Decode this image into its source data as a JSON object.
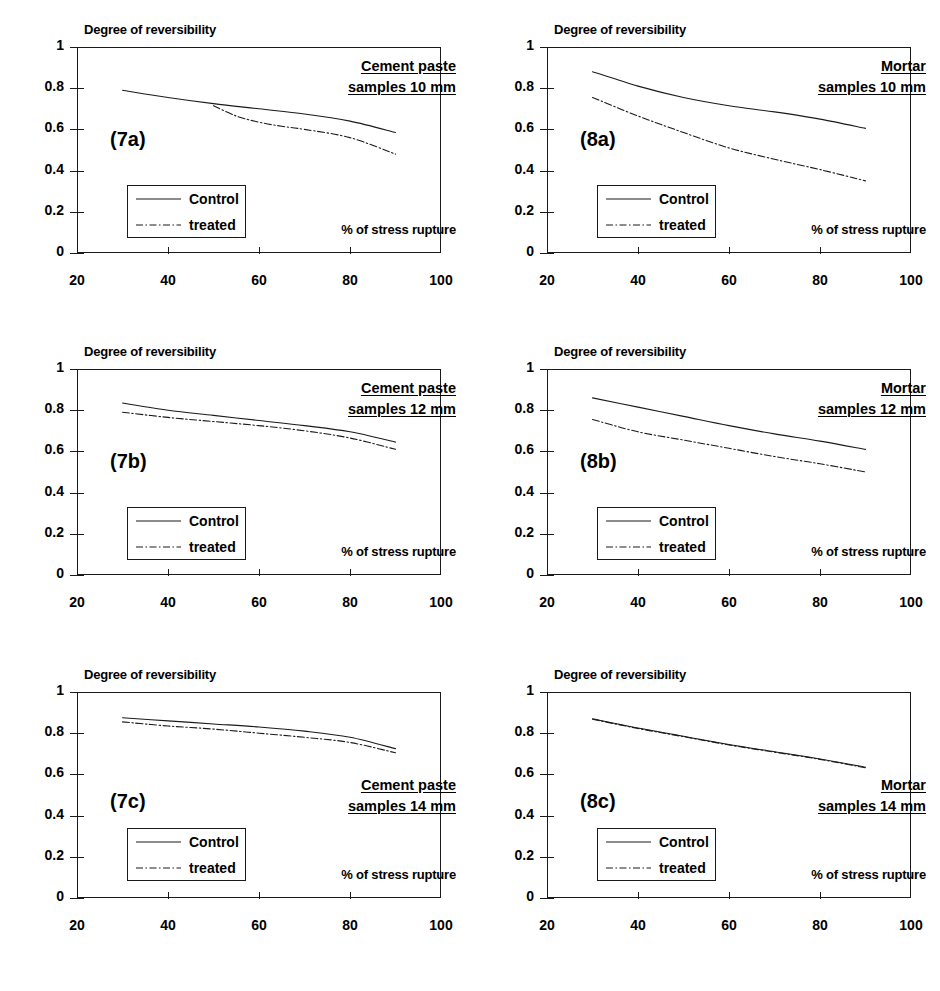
{
  "figure": {
    "axis": {
      "y_title": "Degree of reversibility",
      "x_caption": "% of stress rupture",
      "y_ticks": [
        "0",
        "0.2",
        "0.4",
        "0.6",
        "0.8",
        "1"
      ],
      "x_ticks": [
        "20",
        "40",
        "60",
        "80",
        "100"
      ]
    },
    "legend": {
      "control_label": "Control",
      "treated_label": "treated"
    }
  },
  "chart_data": [
    {
      "type": "line",
      "id": "7a",
      "panel_label": "(7a)",
      "title_line1": "Cement paste",
      "title_line2": "samples 10 mm",
      "title": "Cement paste samples 10 mm",
      "xlabel": "% of stress rupture",
      "ylabel": "Degree of reversibility",
      "xlim": [
        20,
        100
      ],
      "ylim": [
        0,
        1
      ],
      "xticks": [
        20,
        40,
        60,
        80,
        100
      ],
      "yticks": [
        0,
        0.2,
        0.4,
        0.6,
        0.8,
        1
      ],
      "grid": false,
      "legend_position": "lower-left-inside",
      "series": [
        {
          "name": "Control",
          "style": "solid",
          "x": [
            30,
            40,
            50,
            60,
            70,
            80,
            90
          ],
          "values": [
            0.79,
            0.755,
            0.725,
            0.7,
            0.675,
            0.64,
            0.585
          ]
        },
        {
          "name": "treated",
          "style": "dash-dot",
          "x": [
            50,
            55,
            60,
            65,
            70,
            80,
            90
          ],
          "values": [
            0.715,
            0.665,
            0.635,
            0.615,
            0.6,
            0.56,
            0.48
          ]
        }
      ]
    },
    {
      "type": "line",
      "id": "8a",
      "panel_label": "(8a)",
      "title_line1": "Mortar",
      "title_line2": "samples 10 mm",
      "title": "Mortar samples 10 mm",
      "xlabel": "% of stress rupture",
      "ylabel": "Degree of reversibility",
      "xlim": [
        20,
        100
      ],
      "ylim": [
        0,
        1
      ],
      "xticks": [
        20,
        40,
        60,
        80,
        100
      ],
      "yticks": [
        0,
        0.2,
        0.4,
        0.6,
        0.8,
        1
      ],
      "grid": false,
      "legend_position": "lower-left-inside",
      "series": [
        {
          "name": "Control",
          "style": "solid",
          "x": [
            30,
            40,
            50,
            60,
            70,
            80,
            90
          ],
          "values": [
            0.88,
            0.81,
            0.755,
            0.715,
            0.685,
            0.65,
            0.605
          ]
        },
        {
          "name": "treated",
          "style": "dash-dot",
          "x": [
            30,
            40,
            50,
            60,
            70,
            80,
            90
          ],
          "values": [
            0.755,
            0.665,
            0.585,
            0.51,
            0.455,
            0.405,
            0.35
          ]
        }
      ]
    },
    {
      "type": "line",
      "id": "7b",
      "panel_label": "(7b)",
      "title_line1": "Cement paste",
      "title_line2": "samples 12 mm",
      "title": "Cement paste samples 12 mm",
      "xlabel": "% of stress rupture",
      "ylabel": "Degree of reversibility",
      "xlim": [
        20,
        100
      ],
      "ylim": [
        0,
        1
      ],
      "xticks": [
        20,
        40,
        60,
        80,
        100
      ],
      "yticks": [
        0,
        0.2,
        0.4,
        0.6,
        0.8,
        1
      ],
      "grid": false,
      "legend_position": "lower-left-inside",
      "series": [
        {
          "name": "Control",
          "style": "solid",
          "x": [
            30,
            40,
            50,
            60,
            70,
            80,
            90
          ],
          "values": [
            0.835,
            0.8,
            0.775,
            0.75,
            0.725,
            0.695,
            0.645
          ]
        },
        {
          "name": "treated",
          "style": "dash-dot",
          "x": [
            30,
            40,
            50,
            60,
            70,
            80,
            90
          ],
          "values": [
            0.79,
            0.765,
            0.745,
            0.725,
            0.7,
            0.665,
            0.61
          ]
        }
      ]
    },
    {
      "type": "line",
      "id": "8b",
      "panel_label": "(8b)",
      "title_line1": "Mortar",
      "title_line2": "samples 12 mm",
      "title": "Mortar samples 12 mm",
      "xlabel": "% of stress rupture",
      "ylabel": "Degree of reversibility",
      "xlim": [
        20,
        100
      ],
      "ylim": [
        0,
        1
      ],
      "xticks": [
        20,
        40,
        60,
        80,
        100
      ],
      "yticks": [
        0,
        0.2,
        0.4,
        0.6,
        0.8,
        1
      ],
      "grid": false,
      "legend_position": "lower-left-inside",
      "series": [
        {
          "name": "Control",
          "style": "solid",
          "x": [
            30,
            40,
            50,
            60,
            70,
            80,
            90
          ],
          "values": [
            0.86,
            0.815,
            0.77,
            0.725,
            0.685,
            0.65,
            0.61
          ]
        },
        {
          "name": "treated",
          "style": "dash-dot",
          "x": [
            30,
            40,
            50,
            60,
            70,
            80,
            90
          ],
          "values": [
            0.755,
            0.695,
            0.655,
            0.615,
            0.575,
            0.54,
            0.5
          ]
        }
      ]
    },
    {
      "type": "line",
      "id": "7c",
      "panel_label": "(7c)",
      "title_line1": "Cement paste",
      "title_line2": "samples 14 mm",
      "title": "Cement paste samples 14 mm",
      "xlabel": "% of stress rupture",
      "ylabel": "Degree of reversibility",
      "xlim": [
        20,
        100
      ],
      "ylim": [
        0,
        1
      ],
      "xticks": [
        20,
        40,
        60,
        80,
        100
      ],
      "yticks": [
        0,
        0.2,
        0.4,
        0.6,
        0.8,
        1
      ],
      "grid": false,
      "legend_position": "lower-left-inside",
      "series": [
        {
          "name": "Control",
          "style": "solid",
          "x": [
            30,
            40,
            50,
            60,
            70,
            80,
            90
          ],
          "values": [
            0.875,
            0.86,
            0.845,
            0.83,
            0.81,
            0.78,
            0.725
          ]
        },
        {
          "name": "treated",
          "style": "dash-dot",
          "x": [
            30,
            40,
            50,
            60,
            70,
            80,
            90
          ],
          "values": [
            0.855,
            0.835,
            0.82,
            0.8,
            0.78,
            0.755,
            0.705
          ]
        }
      ]
    },
    {
      "type": "line",
      "id": "8c",
      "panel_label": "(8c)",
      "title_line1": "Mortar",
      "title_line2": "samples 14 mm",
      "title": "Mortar samples 14 mm",
      "xlabel": "% of stress rupture",
      "ylabel": "Degree of reversibility",
      "xlim": [
        20,
        100
      ],
      "ylim": [
        0,
        1
      ],
      "xticks": [
        20,
        40,
        60,
        80,
        100
      ],
      "yticks": [
        0,
        0.2,
        0.4,
        0.6,
        0.8,
        1
      ],
      "grid": false,
      "legend_position": "lower-left-inside",
      "series": [
        {
          "name": "Control",
          "style": "solid",
          "x": [
            30,
            40,
            50,
            60,
            70,
            80,
            90
          ],
          "values": [
            0.87,
            0.825,
            0.785,
            0.745,
            0.71,
            0.675,
            0.635
          ]
        },
        {
          "name": "treated",
          "style": "dash-dot",
          "x": [
            30,
            40,
            50,
            60,
            70,
            80,
            90
          ],
          "values": [
            0.868,
            0.823,
            0.783,
            0.743,
            0.708,
            0.673,
            0.632
          ]
        }
      ]
    }
  ],
  "colors": {
    "line": "#1a1a1a",
    "text": "#000000",
    "background": "#ffffff"
  }
}
